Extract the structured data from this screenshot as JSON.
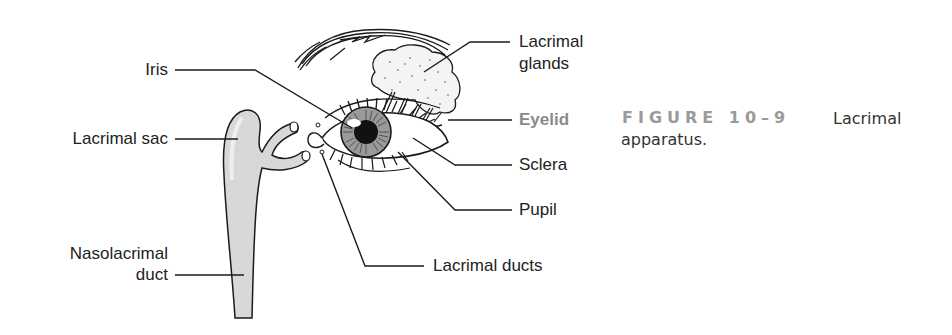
{
  "figure": {
    "labels": {
      "iris": "Iris",
      "lacrimal_sac": "Lacrimal sac",
      "nasolacrimal_duct_line1": "Nasolacrimal",
      "nasolacrimal_duct_line2": "duct",
      "lacrimal_glands_line1": "Lacrimal",
      "lacrimal_glands_line2": "glands",
      "eyelid": "Eyelid",
      "sclera": "Sclera",
      "pupil": "Pupil",
      "lacrimal_ducts": "Lacrimal ducts"
    },
    "caption": {
      "number": "FIGURE 10–9",
      "title_line1": "Lacrimal",
      "title_line2": "apparatus."
    },
    "colors": {
      "line": "#1a1a1a",
      "text": "#222222",
      "highlight_label": "#8a8a8a",
      "caption_number": "#9a9a9a",
      "sac_fill": "#d8d8d8",
      "iris_fill": "#9a9a9a"
    }
  }
}
